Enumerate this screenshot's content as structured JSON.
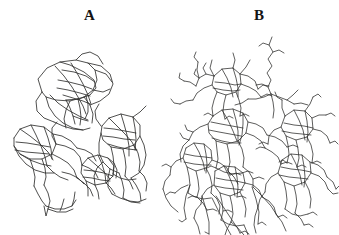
{
  "figure": {
    "background_color": "#ffffff",
    "line_color": "#30302f",
    "width": 339,
    "height": 235,
    "panel_count": 2
  },
  "panels": [
    {
      "id": "panel-a",
      "label": "A",
      "label_position": {
        "x": 84,
        "y": 8
      },
      "description": "Sparse angular polygonal wireframe, three clusters in a C shape",
      "density": "sparse"
    },
    {
      "id": "panel-b",
      "label": "B",
      "label_position": {
        "x": 254,
        "y": 8
      },
      "description": "Dense branching wireframe network with side-chain stubs and long diagonal strands",
      "density": "dense"
    }
  ],
  "chart_data": {
    "type": "line",
    "title": "",
    "xlabel": "",
    "ylabel": "",
    "grid": false,
    "legend": "none",
    "xlim": [
      0,
      339
    ],
    "ylim": [
      0,
      235
    ],
    "series": [
      {
        "name": "A-cluster-upper-left",
        "panel": "A",
        "polylines": [
          "42,92 38,79 47,68 60,62 76,60 88,63 95,70 97,80 93,90 84,97 70,101 56,100 46,97 42,92",
          "60,62 70,65 84,72 94,80 96,88 90,95 79,99 66,100",
          "55,66 64,76 72,87 78,97 83,106 86,114",
          "71,63 77,73 83,84 88,95 91,104",
          "62,70 74,72 86,76 95,82",
          "58,80 69,82 81,85 92,89",
          "57,88 68,90 80,93 90,96",
          "63,95 73,98 83,101 90,104",
          "66,100 70,108 73,116 75,124",
          "78,99 80,108 81,117 80,125",
          "86,96 88,104 88,112 85,119",
          "50,95 58,103 68,110 79,116 88,120",
          "46,97 49,107 55,116 63,123 73,128 83,130",
          "88,63 101,66 110,74 113,84 109,94 100,101 90,105",
          "95,70 106,74 112,82",
          "93,90 103,92 110,89",
          "76,60 82,54 90,52 98,56 103,64",
          "42,92 36,101 37,111 44,118 54,122",
          "70,101 66,110 64,119 66,128",
          "84,97 90,105 93,114 92,123",
          "54,122 63,126 73,129 83,130 90,128",
          "73,116 81,119 88,121"
        ]
      },
      {
        "name": "A-cluster-lower-left",
        "panel": "A",
        "polylines": [
          "14,138 20,129 31,125 44,127 53,134 56,144 52,154 42,159 30,159 20,154 14,146 14,138",
          "20,129 30,136 40,144 48,152 53,160",
          "31,125 36,135 41,146 45,157 47,166",
          "44,127 48,138 51,149 52,159",
          "16,142 27,143 39,145 50,147",
          "15,150 26,152 38,153 49,154",
          "20,154 30,160 41,164 51,166",
          "30,159 33,168 35,177 34,186",
          "42,159 45,168 46,177 44,185",
          "14,146 19,156 26,164 35,170 45,173 54,173",
          "52,154 60,158 68,163 74,170 77,178",
          "56,144 65,146 74,150 80,157 82,165",
          "53,134 62,136 71,141 77,148",
          "47,166 53,172 60,177 68,180",
          "44,185 48,193 50,201 48,209",
          "34,186 38,194 42,201 46,206",
          "46,206 55,209 64,209 72,206 76,200",
          "48,209 57,212 66,212 73,209",
          "62,172 70,174 78,178 84,184",
          "77,178 84,183 90,189 93,196",
          "56,144 52,136 52,128 57,122",
          "77,148 85,150 92,154 96,161",
          "82,165 89,168 95,172 98,178"
        ]
      },
      {
        "name": "A-cluster-lower-left-tail",
        "panel": "A",
        "polylines": [
          "48,209 46,216 44,206",
          "60,211 62,206 64,199",
          "72,206 74,199 75,192"
        ]
      },
      {
        "name": "A-cluster-lower-middle",
        "panel": "A",
        "polylines": [
          "82,165 88,158 98,155 108,158 114,166 113,176 106,183 95,185 86,181 81,173 82,165",
          "88,158 96,165 104,172 110,179",
          "98,155 102,164 105,174 106,183",
          "84,170 94,171 104,173 113,176",
          "83,177 92,178 101,180 110,181",
          "108,158 114,163 117,170 116,178",
          "95,185 98,192 99,199",
          "86,181 88,189 88,196",
          "106,183 111,188 115,194"
        ]
      },
      {
        "name": "A-cluster-right",
        "panel": "A",
        "polylines": [
          "102,126 109,118 121,114 133,117 140,125 140,136 134,145 123,149 111,147 103,140 101,133 102,126",
          "109,118 117,126 125,134 132,142 136,150",
          "121,114 124,124 127,135 129,146 129,156",
          "133,117 135,128 136,139 135,150",
          "104,128 114,129 125,131 136,133",
          "103,136 113,137 124,139 135,140",
          "108,144 118,147 128,149 137,150",
          "111,147 113,156 114,165 113,174",
          "123,149 125,158 126,167 125,176",
          "134,145 138,153 140,162 139,171",
          "101,133 99,143 99,153 103,162 110,169 119,173",
          "140,136 144,145 146,155 144,165 139,173 131,178",
          "113,174 120,178 128,180 136,179",
          "125,176 130,182 133,189",
          "139,171 144,176 147,183 146,191",
          "103,162 97,168 94,176 95,185",
          "110,169 108,178 108,187 112,194",
          "119,173 122,181 124,190 123,198",
          "131,178 136,185 140,193 141,201",
          "112,194 120,198 129,201 138,202 146,199",
          "123,198 131,202 140,203",
          "101,126 96,119 95,111 99,104",
          "133,117 140,112 146,106"
        ]
      },
      {
        "name": "B-strand-top-wavy",
        "panel": "B",
        "polylines": [
          "272,37 269,45 273,52 268,59 272,66 267,73 271,80 268,87 271,94",
          "271,94 264,97 256,99 248,99",
          "271,94 279,97 287,100 294,104",
          "271,94 273,102 274,110 273,118"
        ]
      },
      {
        "name": "B-cluster-upper-left",
        "panel": "B",
        "polylines": [
          "214,76 222,69 233,68 240,74 241,84 236,92 226,95 217,92 212,85 214,76",
          "222,69 227,78 231,88 233,97",
          "233,68 236,78 238,88 238,97",
          "215,82 225,83 235,85 241,84",
          "213,88 223,90 233,91 240,90",
          "214,76 206,74 199,78 196,86",
          "212,85 204,88 197,93 193,100",
          "226,95 224,103 223,111 225,119",
          "236,92 239,100 241,108 240,116",
          "217,92 214,100 212,108 213,116",
          "240,74 248,76 255,81 258,89",
          "241,84 249,87 256,91 261,97",
          "196,86 190,82 184,81",
          "193,100 186,101 180,104",
          "199,78 197,70 198,62"
        ]
      },
      {
        "name": "B-cluster-center",
        "panel": "B",
        "polylines": [
          "213,116 222,110 233,109 243,113 248,122 246,133 238,141 227,144 216,141 209,133 208,124 213,116",
          "222,110 228,120 233,131 237,141",
          "233,109 236,120 238,131 238,142",
          "243,113 243,124 242,135 239,145",
          "211,122 221,124 232,126 243,128",
          "209,130 219,132 230,134 241,136",
          "212,138 222,141 232,143 241,143",
          "216,141 217,150 218,159 216,168",
          "227,144 229,153 230,162 228,171",
          "238,141 242,149 244,158 243,167",
          "208,124 200,127 193,132 189,140",
          "248,122 256,124 263,128 267,135",
          "246,133 254,136 261,141 265,148",
          "189,140 183,146 180,154 181,162",
          "216,168 224,172 233,174 242,173",
          "228,171 234,177 238,184",
          "243,167 249,172 253,179 253,187",
          "267,135 275,137 282,141 287,147",
          "265,148 272,152 278,157 281,164"
        ]
      },
      {
        "name": "B-cluster-left-lower",
        "panel": "B",
        "polylines": [
          "186,148 194,143 204,144 211,150 212,160 206,168 196,171 187,167 183,158 186,148",
          "194,143 199,152 203,162 205,171",
          "204,144 206,154 207,164 206,173",
          "185,154 195,156 205,157 212,158",
          "184,162 194,164 204,165 211,165",
          "187,167 189,176 190,185 188,193",
          "196,171 198,180 199,189 197,197",
          "206,168 210,176 212,185 211,193",
          "183,158 176,161 171,167 170,175",
          "212,160 220,163 227,168 230,175",
          "188,193 195,197 203,199 211,198",
          "197,197 203,203 207,210",
          "211,193 217,199 220,206 219,214",
          "170,175 165,181 163,189",
          "188,185 181,188 175,193"
        ]
      },
      {
        "name": "B-cluster-bottom-middle",
        "panel": "B",
        "polylines": [
          "215,171 224,166 235,167 243,173 245,183 240,192 230,196 220,193 214,185 215,171",
          "224,166 229,176 233,186 235,196",
          "235,167 237,177 238,188 237,197",
          "216,178 226,180 236,181 245,183",
          "215,186 225,188 235,189 243,190",
          "220,193 222,202 223,211 221,220",
          "230,196 232,205 233,214 231,222",
          "240,192 244,200 246,209 245,217",
          "214,185 207,189 202,196 201,204",
          "245,183 253,185 259,190 262,197",
          "221,220 228,224 236,226 244,225",
          "231,222 237,227 240,233",
          "201,204 196,210 194,218",
          "262,197 269,201 274,207 276,214"
        ]
      },
      {
        "name": "B-cluster-right-upper",
        "panel": "B",
        "polylines": [
          "285,116 294,110 305,111 312,118 313,129 307,137 296,140 286,136 281,127 285,116",
          "294,110 299,120 303,130 305,140",
          "305,111 307,121 308,132 307,142",
          "284,123 294,125 304,126 313,128",
          "282,131 292,133 302,134 311,135",
          "286,136 288,145 289,154 287,163",
          "296,140 298,149 299,158 297,167",
          "307,137 311,145 313,154 312,163",
          "281,127 274,130 269,136 268,144",
          "313,129 321,131 327,136 330,143",
          "312,118 319,115 326,115",
          "285,116 282,108 282,100",
          "305,111 310,104 313,97"
        ]
      },
      {
        "name": "B-cluster-right-lower",
        "panel": "B",
        "polylines": [
          "282,160 291,154 302,155 310,162 311,173 305,182 294,186 284,182 278,173 282,160",
          "291,154 296,164 300,175 302,185",
          "302,155 304,166 305,177 304,187",
          "281,167 291,169 301,170 311,172",
          "279,175 289,177 299,178 308,179",
          "284,182 286,191 287,200 285,209",
          "294,186 296,195 297,204 295,213",
          "305,182 309,190 311,199 310,208",
          "278,173 271,177 266,184 265,192",
          "310,162 318,165 324,170 327,177",
          "311,173 319,176 325,182 328,189",
          "285,209 292,214 300,216 308,214",
          "295,213 301,219 304,225",
          "265,192 260,199 258,207",
          "327,177 333,182 336,189"
        ]
      },
      {
        "name": "B-long-diagonals",
        "panel": "B",
        "polylines": [
          "216,196 226,211 236,226 244,235",
          "212,198 219,212 226,226 231,235",
          "202,196 206,209 209,222 209,234",
          "252,187 256,199 259,212 258,224",
          "253,187 262,196 271,206 278,217",
          "190,185 186,196 184,208 186,219",
          "276,214 282,222 286,231",
          "244,225 247,232 248,235",
          "231,222 227,229 225,235",
          "258,207 255,216 254,225 256,233",
          "163,189 166,198 171,206 178,212",
          "194,218 198,226 200,234"
        ]
      },
      {
        "name": "B-side-chain-stubs",
        "panel": "B",
        "polylines": [
          "199,78 194,74 196,69",
          "206,74 203,68 206,63",
          "184,81 179,78 180,73",
          "180,104 174,103 171,99",
          "198,62 194,57 196,52",
          "258,89 263,85 269,86",
          "261,97 267,94 272,96",
          "193,132 187,130 185,125",
          "189,140 183,138 180,133",
          "287,147 293,145 298,147",
          "281,164 287,162 292,164",
          "330,143 335,141 338,144",
          "326,115 331,113 335,116",
          "313,97 318,94 321,97",
          "282,100 277,97 275,92",
          "336,189 339,186",
          "328,189 333,194 338,193",
          "253,179 259,177 264,179",
          "242,173 248,171 253,173",
          "230,175 236,173 241,175",
          "171,167 166,164 162,166",
          "175,193 170,192 166,195",
          "207,210 213,209 217,211",
          "240,233 245,231 249,234",
          "304,225 309,224 313,227",
          "308,214 313,212 317,215",
          "312,163 317,161 321,163",
          "297,167 302,165 306,167",
          "287,163 283,160 279,162",
          "268,144 263,142 259,144",
          "265,148 260,147 256,149",
          "216,168 211,166 207,168",
          "213,116 208,113 204,115",
          "240,116 245,114 249,116",
          "225,119 229,116 233,118",
          "237,197 242,196 246,198",
          "223,211 228,210 232,212",
          "197,197 192,196 188,198",
          "186,219 182,222 179,220",
          "209,234 205,232",
          "278,217 283,215 287,218",
          "258,224 262,222 266,225"
        ]
      },
      {
        "name": "B-upper-fringe",
        "panel": "B",
        "polylines": [
          "240,74 246,67 250,60",
          "233,68 235,60 233,53",
          "214,76 210,68 212,60",
          "248,99 242,103 235,105",
          "294,104 301,103 308,105",
          "287,100 293,95 298,90",
          "268,87 262,84 256,85",
          "273,52 279,50 284,53",
          "269,45 263,43 259,46"
        ]
      }
    ]
  }
}
